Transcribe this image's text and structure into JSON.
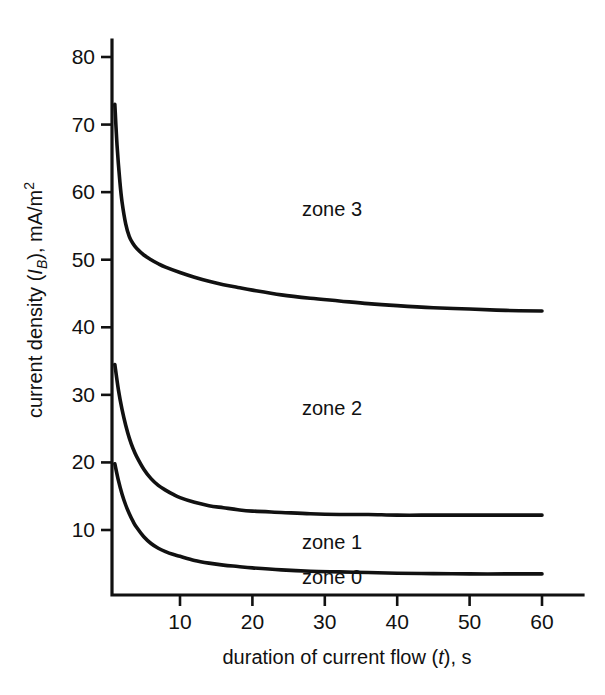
{
  "chart_data": {
    "type": "line",
    "title": "",
    "xlabel": "duration of current flow (t), s",
    "ylabel": "current density (IB), mA/m2",
    "xlabel_parts": {
      "pre": "duration of current flow (",
      "italic": "t",
      "post": "), s"
    },
    "ylabel_parts": {
      "pre": "current density (",
      "italic": "I",
      "sub": "B",
      "post": "), mA/m",
      "sup": "2"
    },
    "xlim": [
      0,
      65
    ],
    "ylim": [
      0,
      84
    ],
    "xticks": [
      10,
      20,
      30,
      40,
      50,
      60
    ],
    "xticklabels": [
      "10",
      "20",
      "30",
      "40",
      "50",
      "60"
    ],
    "yticks": [
      10,
      20,
      30,
      40,
      50,
      60,
      70,
      80
    ],
    "yticklabels": [
      "10",
      "20",
      "30",
      "40",
      "50",
      "60",
      "70",
      "80"
    ],
    "grid": false,
    "legend_position": "none",
    "annotations": [
      {
        "text": "zone 3",
        "x": 31.0,
        "y": 57.5
      },
      {
        "text": "zone 2",
        "x": 31.0,
        "y": 28.0
      },
      {
        "text": "zone 1",
        "x": 31.0,
        "y": 8.2
      },
      {
        "text": "zone 0",
        "x": 31.0,
        "y": 3.0
      }
    ],
    "series": [
      {
        "name": "boundary zone 3 / zone 2",
        "x": [
          1.0,
          1.3,
          1.7,
          2.0,
          2.5,
          3.0,
          3.5,
          4.0,
          5.0,
          6.0,
          7.0,
          8.0,
          10.0,
          12.0,
          14.0,
          16.0,
          18.0,
          20.0,
          24.0,
          28.0,
          32.0,
          36.0,
          40.0,
          45.0,
          50.0,
          55.0,
          60.0
        ],
        "y": [
          73.0,
          67.0,
          61.5,
          58.5,
          55.3,
          53.4,
          52.4,
          51.7,
          50.7,
          50.0,
          49.4,
          48.9,
          48.1,
          47.4,
          46.8,
          46.3,
          45.9,
          45.5,
          44.8,
          44.3,
          43.9,
          43.5,
          43.2,
          42.9,
          42.7,
          42.5,
          42.4
        ]
      },
      {
        "name": "boundary zone 2 / zone 1",
        "x": [
          1.0,
          1.5,
          2.0,
          2.5,
          3.0,
          3.5,
          4.0,
          5.0,
          6.0,
          7.0,
          8.0,
          9.0,
          10.0,
          12.0,
          14.0,
          16.0,
          18.0,
          20.0,
          24.0,
          28.0,
          32.0,
          36.0,
          40.0,
          45.0,
          50.0,
          55.0,
          60.0
        ],
        "y": [
          34.5,
          30.7,
          27.8,
          25.5,
          23.6,
          22.1,
          20.9,
          19.0,
          17.6,
          16.6,
          15.9,
          15.3,
          14.8,
          14.1,
          13.6,
          13.3,
          13.0,
          12.8,
          12.6,
          12.4,
          12.3,
          12.3,
          12.2,
          12.2,
          12.2,
          12.2,
          12.2
        ]
      },
      {
        "name": "boundary zone 1 / zone 0",
        "x": [
          1.0,
          1.5,
          2.0,
          2.5,
          3.0,
          3.5,
          4.0,
          5.0,
          6.0,
          7.0,
          8.0,
          9.0,
          10.0,
          12.0,
          14.0,
          16.0,
          18.0,
          20.0,
          24.0,
          28.0,
          32.0,
          36.0,
          40.0,
          45.0,
          50.0,
          55.0,
          60.0
        ],
        "y": [
          19.8,
          17.3,
          15.3,
          13.7,
          12.4,
          11.3,
          10.4,
          9.0,
          8.0,
          7.3,
          6.8,
          6.4,
          6.1,
          5.5,
          5.1,
          4.8,
          4.6,
          4.4,
          4.1,
          3.9,
          3.8,
          3.7,
          3.6,
          3.55,
          3.5,
          3.5,
          3.5
        ]
      }
    ]
  }
}
